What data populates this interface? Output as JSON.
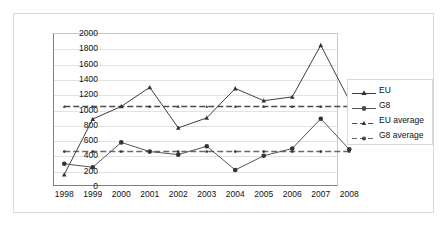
{
  "chart_data": {
    "type": "line",
    "title": "",
    "xlabel": "",
    "ylabel": "",
    "x": [
      1998,
      1999,
      2000,
      2001,
      2002,
      2003,
      2004,
      2005,
      2006,
      2007,
      2008
    ],
    "xtick_labels": [
      "1998",
      "1999",
      "2000",
      "2001",
      "2002",
      "2003",
      "2004",
      "2005",
      "2006",
      "2007",
      "2008"
    ],
    "ytick_labels": [
      "2000",
      "1800",
      "1600",
      "1400",
      "1200",
      "1000",
      "800",
      "600",
      "400",
      "200",
      "0"
    ],
    "ylim": [
      0,
      2000
    ],
    "ytick_step": 200,
    "grid": true,
    "legend_position": "right",
    "series": [
      {
        "name": "EU",
        "marker": "triangle",
        "line_style": "solid",
        "color": "#3f3f3f",
        "values": [
          150,
          875,
          1040,
          1290,
          760,
          890,
          1275,
          1115,
          1165,
          1840,
          1120
        ]
      },
      {
        "name": "G8",
        "marker": "circle",
        "line_style": "solid",
        "color": "#555555",
        "values": [
          290,
          245,
          570,
          450,
          410,
          520,
          210,
          395,
          490,
          880,
          480
        ]
      },
      {
        "name": "EU average",
        "marker": "triangle",
        "line_style": "dashed",
        "color": "#4a4a4a",
        "constant": 1040,
        "values": [
          1040,
          1040,
          1040,
          1040,
          1040,
          1040,
          1040,
          1040,
          1040,
          1040,
          1040
        ]
      },
      {
        "name": "G8 average",
        "marker": "circle",
        "line_style": "dashed",
        "color": "#6a6a6a",
        "constant": 450,
        "values": [
          450,
          450,
          450,
          450,
          450,
          450,
          450,
          450,
          450,
          450,
          450
        ]
      }
    ]
  },
  "legend": {
    "items": [
      {
        "label": "EU"
      },
      {
        "label": "G8"
      },
      {
        "label": "EU average"
      },
      {
        "label": "G8 average"
      }
    ]
  }
}
